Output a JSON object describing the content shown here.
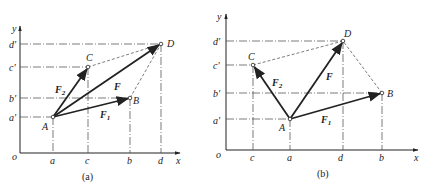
{
  "figure": {
    "panels": [
      {
        "id": "a",
        "caption": "(a)",
        "axes": {
          "origin_label": "o",
          "x_label": "x",
          "y_label": "y"
        },
        "x_ticks": [
          "a",
          "c",
          "b",
          "d"
        ],
        "y_ticks": [
          "a'",
          "b'",
          "c'",
          "d'"
        ],
        "points": {
          "A": "A",
          "B": "B",
          "C": "C",
          "D": "D"
        },
        "vectors": {
          "F1": "F",
          "F1_sub": "1",
          "F2": "F",
          "F2_sub": "2",
          "F": "F"
        }
      },
      {
        "id": "b",
        "caption": "(b)",
        "axes": {
          "origin_label": "o",
          "x_label": "x",
          "y_label": "y"
        },
        "x_ticks": [
          "c",
          "a",
          "d",
          "b"
        ],
        "y_ticks": [
          "a'",
          "b'",
          "c'",
          "d'"
        ],
        "points": {
          "A": "A",
          "B": "B",
          "C": "C",
          "D": "D"
        },
        "vectors": {
          "F1": "F",
          "F1_sub": "1",
          "F2": "F",
          "F2_sub": "2",
          "F": "F"
        }
      }
    ]
  },
  "colors": {
    "ink": "#222222",
    "background": "#ffffff"
  }
}
